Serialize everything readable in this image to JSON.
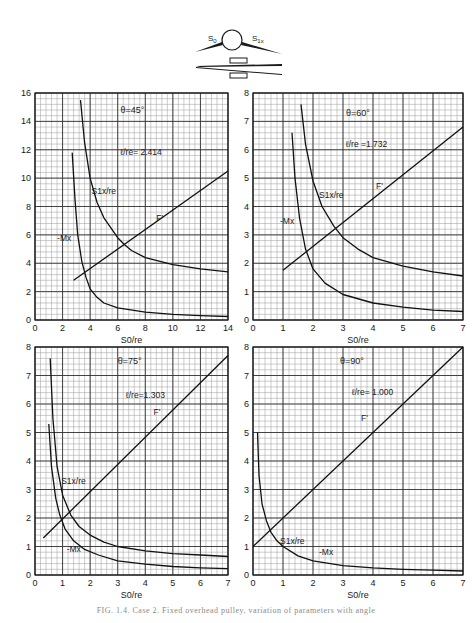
{
  "figure": {
    "caption": "FIG. 1.4. Case 2. Fixed overhead pulley, variation of parameters with angle",
    "diagram": {
      "labels": [
        "S0",
        "S1x"
      ]
    }
  },
  "chart_data": [
    {
      "type": "line",
      "title": "θ=45°",
      "annotation": "ℓ/re = 2.414",
      "xlabel": "S0/re",
      "ylabel": "",
      "xlim": [
        0,
        14
      ],
      "ylim": [
        0,
        16
      ],
      "xticks": [
        0,
        2,
        4,
        6,
        8,
        10,
        12,
        14
      ],
      "yticks": [
        0,
        2,
        4,
        6,
        8,
        10,
        12,
        14,
        16
      ],
      "grid": true,
      "series": [
        {
          "name": "S1x/re",
          "x": [
            3.3,
            3.6,
            4,
            4.5,
            5,
            6,
            6.5,
            7,
            8,
            10,
            12,
            14
          ],
          "y": [
            15.5,
            12.5,
            10,
            8.3,
            7.2,
            5.8,
            5.3,
            4.9,
            4.4,
            3.9,
            3.6,
            3.4
          ]
        },
        {
          "name": "-Mx",
          "x": [
            2.7,
            2.9,
            3.1,
            3.4,
            3.7,
            4,
            4.5,
            5,
            6,
            8,
            10,
            12,
            14
          ],
          "y": [
            11.8,
            8.5,
            6,
            4.1,
            3.0,
            2.2,
            1.6,
            1.2,
            0.85,
            0.55,
            0.4,
            0.3,
            0.25
          ]
        },
        {
          "name": "F'",
          "x": [
            2.8,
            14
          ],
          "y": [
            2.8,
            10.5
          ]
        }
      ]
    },
    {
      "type": "line",
      "title": "θ=60°",
      "annotation": "ℓ/re = 1.732",
      "xlabel": "S0/re",
      "ylabel": "",
      "xlim": [
        0,
        7
      ],
      "ylim": [
        0,
        8
      ],
      "xticks": [
        0,
        1,
        2,
        3,
        4,
        5,
        6,
        7
      ],
      "yticks": [
        0,
        1,
        2,
        3,
        4,
        5,
        6,
        7,
        8
      ],
      "grid": true,
      "series": [
        {
          "name": "S1x/re",
          "x": [
            1.6,
            1.75,
            2,
            2.3,
            2.7,
            3,
            3.5,
            4,
            5,
            6,
            7
          ],
          "y": [
            7.6,
            6.2,
            4.9,
            4.0,
            3.3,
            2.9,
            2.5,
            2.2,
            1.9,
            1.7,
            1.55
          ]
        },
        {
          "name": "-Mx",
          "x": [
            1.3,
            1.4,
            1.55,
            1.75,
            2,
            2.4,
            3,
            4,
            5,
            6,
            7
          ],
          "y": [
            6.6,
            5.0,
            3.6,
            2.5,
            1.8,
            1.3,
            0.9,
            0.6,
            0.45,
            0.35,
            0.3
          ]
        },
        {
          "name": "F'",
          "x": [
            1,
            7
          ],
          "y": [
            1.75,
            6.8
          ]
        }
      ]
    },
    {
      "type": "line",
      "title": "θ=75°",
      "annotation": "ℓ/re = 1.303",
      "xlabel": "S0/re",
      "ylabel": "",
      "xlim": [
        0,
        7
      ],
      "ylim": [
        0,
        8
      ],
      "xticks": [
        0,
        1,
        2,
        3,
        4,
        5,
        6,
        7
      ],
      "yticks": [
        0,
        1,
        2,
        3,
        4,
        5,
        6,
        7,
        8
      ],
      "grid": true,
      "series": [
        {
          "name": "S1x/re",
          "x": [
            0.55,
            0.65,
            0.8,
            1,
            1.3,
            1.6,
            2,
            2.5,
            3,
            4,
            5,
            6,
            7
          ],
          "y": [
            7.6,
            5.5,
            3.8,
            2.8,
            2.1,
            1.7,
            1.4,
            1.15,
            1.0,
            0.85,
            0.75,
            0.7,
            0.65
          ]
        },
        {
          "name": "-Mx",
          "x": [
            0.5,
            0.6,
            0.75,
            0.9,
            1.1,
            1.4,
            1.8,
            2.3,
            3,
            4,
            5,
            6,
            7
          ],
          "y": [
            5.3,
            3.8,
            2.7,
            2.1,
            1.6,
            1.2,
            0.9,
            0.7,
            0.5,
            0.38,
            0.3,
            0.25,
            0.22
          ]
        },
        {
          "name": "F'",
          "x": [
            0.3,
            7
          ],
          "y": [
            1.3,
            7.7
          ]
        }
      ]
    },
    {
      "type": "line",
      "title": "θ=90°",
      "annotation": "ℓ/re = 1.000",
      "xlabel": "S0/re",
      "ylabel": "",
      "xlim": [
        0,
        7
      ],
      "ylim": [
        0,
        8
      ],
      "xticks": [
        0,
        1,
        2,
        3,
        4,
        5,
        6,
        7
      ],
      "yticks": [
        0,
        1,
        2,
        3,
        4,
        5,
        6,
        7,
        8
      ],
      "grid": true,
      "series": [
        {
          "name": "S1x/re = -Mx",
          "x": [
            0.15,
            0.2,
            0.3,
            0.45,
            0.6,
            0.8,
            1,
            1.5,
            2,
            3,
            4,
            5,
            6,
            7
          ],
          "y": [
            5.0,
            3.5,
            2.5,
            1.9,
            1.5,
            1.2,
            1.0,
            0.67,
            0.5,
            0.33,
            0.25,
            0.2,
            0.17,
            0.14
          ]
        },
        {
          "name": "F'",
          "x": [
            0,
            7
          ],
          "y": [
            1,
            8
          ]
        }
      ],
      "labels": [
        "S1x/re",
        "-Mx",
        "F'"
      ]
    }
  ],
  "panels": [
    {
      "theta": "θ=45°",
      "lratio": "ℓ/re= 2.414",
      "xlabel": "S0/re",
      "s1x_label": "S1x/re",
      "mx_label": "-Mx",
      "f_label": "F'"
    },
    {
      "theta": "θ=60°",
      "lratio": "ℓ/re =1.732",
      "xlabel": "S0/re",
      "s1x_label": "S1x/re",
      "mx_label": "-Mx",
      "f_label": "F'"
    },
    {
      "theta": "θ=75°",
      "lratio": "ℓ/re=1.303",
      "xlabel": "S0/re",
      "s1x_label": "S1x/re",
      "mx_label": "-Mx",
      "f_label": "F'"
    },
    {
      "theta": "θ=90°",
      "lratio": "ℓ/re= 1.000",
      "xlabel": "S0/re",
      "s1x_label": "S1x/re",
      "mx_label": "-Mx",
      "f_label": "F'"
    }
  ]
}
